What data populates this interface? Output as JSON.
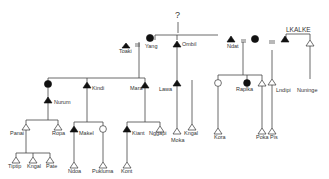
{
  "diagram": {
    "type": "kinship-chart",
    "unknown_marker": "?",
    "marriage_symbol": "=",
    "group_label": "LKALKE",
    "colors": {
      "line": "#444444",
      "fill": "#111111",
      "background": "#ffffff"
    },
    "legend": {
      "filled_triangle": "male (filled)",
      "open_triangle": "male (open)",
      "filled_circle": "female (filled)",
      "open_circle": "female (open)"
    },
    "people": {
      "toaki": "Toaki",
      "yang": "Yang",
      "ombil": "Ombil",
      "ndat": "Ndat",
      "lkalke": "LKALKE",
      "nurum": "Nurum",
      "kindi": "Kindi",
      "mara": "Mara",
      "lawa": "Lawa",
      "raplka": "Raplka",
      "lndipi": "Lndipi",
      "nuninge": "Nuninge",
      "panai": "Panai",
      "ropa": "Ropa",
      "makel": "Makel",
      "kiant": "Kiant",
      "nggapi": "Nggapi",
      "moka": "Moka",
      "kngal": "Kngal",
      "kora": "Kora",
      "poka": "Poka",
      "pis": "Pis",
      "tiptip": "Tiptip",
      "kngal2": "Kngal",
      "pate": "Pate",
      "ndoa": "Ndoa",
      "pukluma": "Pukluma",
      "kont": "Kont"
    }
  }
}
